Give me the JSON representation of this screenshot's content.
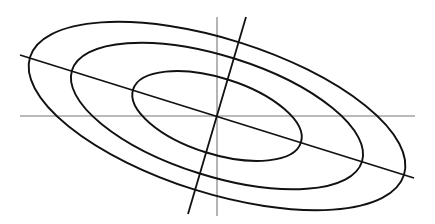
{
  "diagram": {
    "type": "concentric-ellipses-with-axes",
    "center": [
      217,
      116
    ],
    "rotation_deg": 17.5,
    "ellipses": [
      {
        "name": "outer",
        "rx": 196,
        "ry": 77
      },
      {
        "name": "middle",
        "rx": 152,
        "ry": 60
      },
      {
        "name": "inner",
        "rx": 88,
        "ry": 38
      }
    ],
    "axes": {
      "horizontal": {
        "x1": 20,
        "y1": 116,
        "x2": 415,
        "y2": 116
      },
      "vertical": {
        "x1": 217,
        "y1": 17,
        "x2": 217,
        "y2": 216
      },
      "major_diameter": {
        "x1": 20,
        "y1": 55,
        "x2": 414,
        "y2": 178
      },
      "conjugate_diameter": {
        "x1": 246,
        "y1": 17,
        "x2": 188,
        "y2": 214
      }
    },
    "colors": {
      "curve": "#111111",
      "axis": "#777777",
      "background": "#ffffff"
    }
  }
}
